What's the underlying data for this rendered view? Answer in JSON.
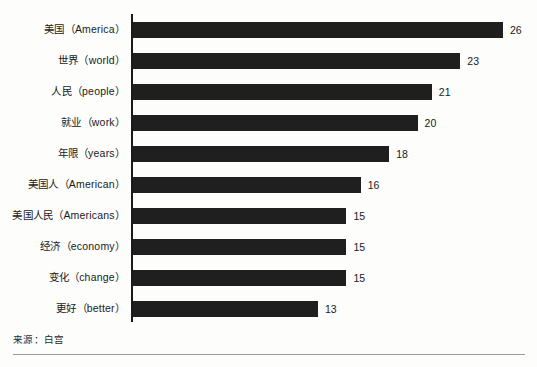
{
  "chart_data": {
    "type": "bar",
    "orientation": "horizontal",
    "title": "",
    "xlabel": "",
    "ylabel": "",
    "grid": false,
    "legend": null,
    "xlim": [
      0,
      26
    ],
    "categories": [
      "美国（America）",
      "世界（world）",
      "人民（people）",
      "就业（work）",
      "年限（years）",
      "美国人（American）",
      "美国人民（Americans）",
      "经济（economy）",
      "变化（change）",
      "更好（better）"
    ],
    "values": [
      26,
      23,
      21,
      20,
      18,
      16,
      15,
      15,
      15,
      13
    ],
    "value_labels": [
      "26",
      "23",
      "21",
      "20",
      "18",
      "16",
      "15",
      "15",
      "15",
      "13"
    ],
    "annotations": {
      "source": "来源：白宫"
    },
    "colors": {
      "bar": "#1f1f1f",
      "axis": "#1a1a1a",
      "text": "#1a1a1a",
      "background": "#fdfdfc",
      "rule": "#9a9a9a"
    }
  }
}
